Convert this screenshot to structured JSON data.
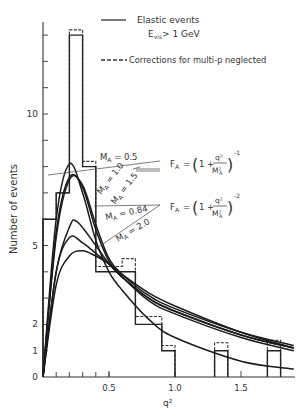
{
  "chart_data": {
    "type": "bar",
    "title": "",
    "xlabel": "q²",
    "ylabel": "Number of events",
    "xlim": [
      0,
      1.9
    ],
    "ylim": [
      0,
      13
    ],
    "grid": false,
    "x_ticks": [
      {
        "value": 0.5,
        "label": "0.5"
      },
      {
        "value": 1.0,
        "label": "1.0"
      },
      {
        "value": 1.5,
        "label": "1.5"
      }
    ],
    "y_ticks": [
      {
        "value": 0,
        "label": "0"
      },
      {
        "value": 1,
        "label": "1"
      },
      {
        "value": 2,
        "label": "2"
      },
      {
        "value": 5,
        "label": "5"
      },
      {
        "value": 10,
        "label": "10"
      }
    ],
    "legend": [
      {
        "style": "solid",
        "label": "Elastic events",
        "sublabel_main": "E",
        "sublabel_sub": "vis",
        "sublabel_rest": "> 1 GeV"
      },
      {
        "style": "dashed",
        "label": "Corrections for multi-p neglected"
      }
    ],
    "bins": [
      {
        "lo": 0.0,
        "hi": 0.1,
        "solid": 6,
        "dashed": 6
      },
      {
        "lo": 0.1,
        "hi": 0.2,
        "solid": 7,
        "dashed": 7
      },
      {
        "lo": 0.2,
        "hi": 0.3,
        "solid": 13,
        "dashed": 13.2
      },
      {
        "lo": 0.3,
        "hi": 0.4,
        "solid": 8,
        "dashed": 8.2
      },
      {
        "lo": 0.4,
        "hi": 0.5,
        "solid": 4,
        "dashed": 4.2
      },
      {
        "lo": 0.5,
        "hi": 0.6,
        "solid": 4,
        "dashed": 4.2
      },
      {
        "lo": 0.6,
        "hi": 0.7,
        "solid": 4,
        "dashed": 4.5
      },
      {
        "lo": 0.7,
        "hi": 0.8,
        "solid": 2,
        "dashed": 2.3
      },
      {
        "lo": 0.8,
        "hi": 0.9,
        "solid": 2,
        "dashed": 2.3
      },
      {
        "lo": 0.9,
        "hi": 1.0,
        "solid": 1,
        "dashed": 1.2
      },
      {
        "lo": 1.3,
        "hi": 1.4,
        "solid": 1,
        "dashed": 1.3
      },
      {
        "lo": 1.7,
        "hi": 1.8,
        "solid": 1,
        "dashed": 1.4
      }
    ],
    "series": [
      {
        "name": "M_A = 0.5 (monopole)",
        "form_factor": "monopole",
        "MA": 0.5,
        "x": [
          0,
          0.1,
          0.2,
          0.3,
          0.4,
          0.5,
          0.6,
          0.8,
          1.0,
          1.5,
          1.9
        ],
        "values": [
          0,
          6.0,
          8.1,
          7.0,
          5.2,
          4.0,
          3.3,
          2.2,
          1.5,
          0.6,
          0.3
        ]
      },
      {
        "name": "M_A = 1.0 (monopole)",
        "form_factor": "monopole",
        "MA": 1.0,
        "x": [
          0,
          0.1,
          0.2,
          0.3,
          0.4,
          0.5,
          0.6,
          0.8,
          1.0,
          1.5,
          1.9
        ],
        "values": [
          0,
          5.5,
          7.6,
          7.2,
          5.6,
          4.4,
          3.8,
          3.0,
          2.5,
          1.6,
          1.1
        ]
      },
      {
        "name": "M_A = 1.5 (monopole)",
        "form_factor": "monopole",
        "MA": 1.5,
        "x": [
          0,
          0.1,
          0.2,
          0.3,
          0.4,
          0.5,
          0.6,
          0.8,
          1.0,
          1.5,
          1.9
        ],
        "values": [
          0,
          5.3,
          7.5,
          7.3,
          5.8,
          4.5,
          3.9,
          3.1,
          2.6,
          1.7,
          1.2
        ]
      },
      {
        "name": "M_A = 0.84 (dipole)",
        "form_factor": "dipole",
        "MA": 0.84,
        "x": [
          0,
          0.1,
          0.2,
          0.26,
          0.4,
          0.5,
          0.6,
          0.8,
          1.0,
          1.5,
          1.9
        ],
        "values": [
          0,
          4.0,
          5.7,
          5.9,
          5.0,
          4.3,
          3.8,
          2.9,
          2.4,
          1.5,
          1.0
        ]
      },
      {
        "name": "M_A = 2.0 (dipole)",
        "form_factor": "dipole",
        "MA": 2.0,
        "x": [
          0,
          0.1,
          0.2,
          0.3,
          0.4,
          0.5,
          0.6,
          0.8,
          1.0,
          1.5,
          1.9
        ],
        "values": [
          0,
          3.5,
          4.6,
          4.8,
          4.6,
          4.3,
          3.9,
          3.2,
          2.7,
          1.7,
          1.1
        ]
      },
      {
        "name": "M_A = 1.0 (dipole, middle)",
        "form_factor": "dipole",
        "MA": 1.0,
        "x": [
          0,
          0.1,
          0.2,
          0.3,
          0.4,
          0.5,
          0.6,
          0.8,
          1.0,
          1.5,
          1.9
        ],
        "values": [
          0,
          4.0,
          5.3,
          5.1,
          4.7,
          4.3,
          3.8,
          3.0,
          2.5,
          1.6,
          1.1
        ]
      }
    ],
    "annotations": [
      {
        "text_main": "M",
        "text_sub": "A",
        "text_rest": " = 0.5"
      },
      {
        "text_main": "M",
        "text_sub": "A",
        "text_rest": " = 1.0"
      },
      {
        "text_main": "M",
        "text_sub": "A",
        "text_rest": " = 1.5"
      },
      {
        "text_main": "M",
        "text_sub": "A",
        "text_rest": " = 0.84"
      },
      {
        "text_main": "M",
        "text_sub": "A",
        "text_rest": " = 2.0"
      }
    ],
    "formulas": [
      {
        "lhs_main": "F",
        "lhs_sub": "A",
        "body": "= (1 + q²/M²A)",
        "exponent": "-1"
      },
      {
        "lhs_main": "F",
        "lhs_sub": "A",
        "body": "= (1 + q²/M²A)",
        "exponent": "-2"
      }
    ]
  }
}
